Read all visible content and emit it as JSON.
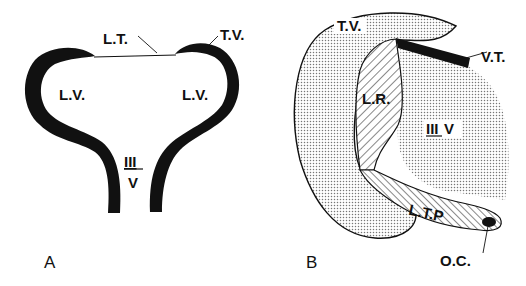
{
  "figure": {
    "panels": [
      {
        "id": "A",
        "label": "A",
        "structures": {
          "lt": "L.T.",
          "tv": "T.V.",
          "lv_left": "L.V.",
          "lv_right": "L.V.",
          "third_v_numeral": "III",
          "third_v_letter": "V"
        }
      },
      {
        "id": "B",
        "label": "B",
        "structures": {
          "tv": "T.V.",
          "vt": "V.T.",
          "lr": "L.R.",
          "third_v_numeral": "III",
          "third_v_letter": "V",
          "ltp": "L.T.P",
          "oc": "O.C."
        }
      }
    ],
    "colors": {
      "ink": "#111111",
      "stipple": "#bdbdbd",
      "background": "#ffffff"
    }
  }
}
